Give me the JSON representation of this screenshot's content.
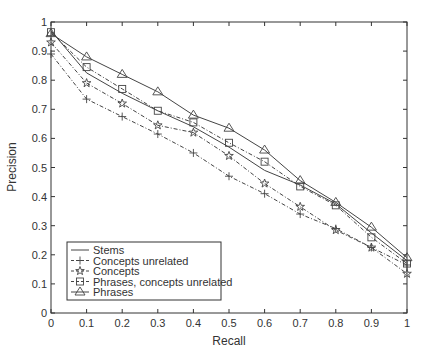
{
  "chart_data": {
    "type": "line",
    "title": "",
    "xlabel": "Recall",
    "ylabel": "Precision",
    "xlim": [
      0,
      1
    ],
    "ylim": [
      0,
      1
    ],
    "grid": false,
    "legend_position": "lower left",
    "x": [
      0,
      0.1,
      0.2,
      0.3,
      0.4,
      0.5,
      0.6,
      0.7,
      0.8,
      0.9,
      1.0
    ],
    "x_ticks": [
      "0",
      "0.1",
      "0.2",
      "0.3",
      "0.4",
      "0.5",
      "0.6",
      "0.7",
      "0.8",
      "0.9",
      "1"
    ],
    "y_ticks": [
      "0",
      "0.1",
      "0.2",
      "0.3",
      "0.4",
      "0.5",
      "0.6",
      "0.7",
      "0.8",
      "0.9",
      "1"
    ],
    "series": [
      {
        "name": "Stems",
        "marker": "none",
        "dash": "solid",
        "values": [
          0.97,
          0.825,
          0.755,
          0.695,
          0.64,
          0.57,
          0.49,
          0.44,
          0.375,
          0.275,
          0.18
        ]
      },
      {
        "name": "Concepts unrelated",
        "marker": "plus",
        "dash": "dashed",
        "values": [
          0.89,
          0.735,
          0.675,
          0.615,
          0.55,
          0.47,
          0.41,
          0.34,
          0.29,
          0.225,
          0.165
        ]
      },
      {
        "name": "Concepts",
        "marker": "star",
        "dash": "dashed",
        "values": [
          0.93,
          0.79,
          0.72,
          0.645,
          0.62,
          0.54,
          0.445,
          0.365,
          0.285,
          0.225,
          0.135
        ]
      },
      {
        "name": "Phrases, concepts unrelated",
        "marker": "square",
        "dash": "dashed",
        "values": [
          0.965,
          0.845,
          0.77,
          0.695,
          0.655,
          0.585,
          0.52,
          0.435,
          0.37,
          0.26,
          0.17
        ]
      },
      {
        "name": "Phrases",
        "marker": "triangle",
        "dash": "solid",
        "values": [
          0.96,
          0.88,
          0.82,
          0.76,
          0.68,
          0.635,
          0.56,
          0.455,
          0.38,
          0.295,
          0.19
        ]
      }
    ]
  },
  "colors": {
    "line": "#444444",
    "axis": "#333333",
    "text": "#333333"
  }
}
